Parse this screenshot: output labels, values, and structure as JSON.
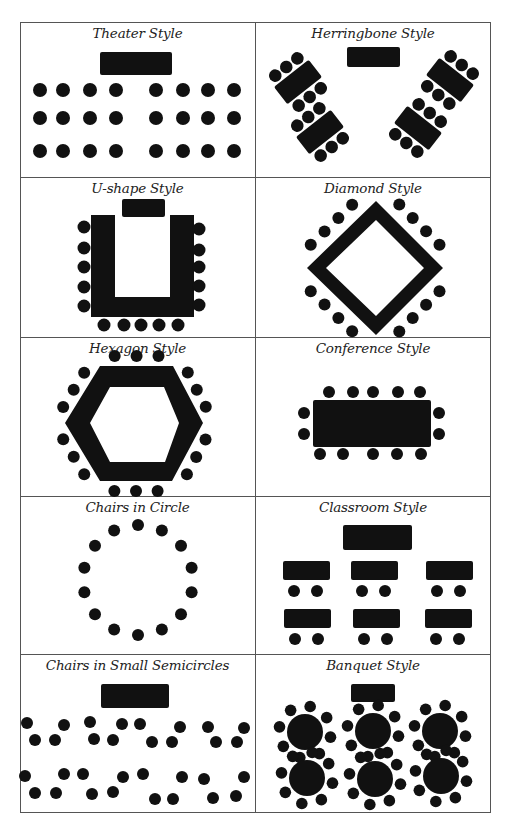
{
  "diagram": {
    "layouts": [
      {
        "id": "theater",
        "label": "Theater Style",
        "head_tables": 1,
        "chairs": 24
      },
      {
        "id": "herringbone",
        "label": "Herringbone Style",
        "head_tables": 1,
        "tables": 4,
        "chairs_per_table": 6
      },
      {
        "id": "u-shape",
        "label": "U-shape Style",
        "head_tables": 1,
        "chairs": 15
      },
      {
        "id": "diamond",
        "label": "Diamond Style",
        "chairs": 16
      },
      {
        "id": "hexagon",
        "label": "Hexagon Style",
        "chairs": 18
      },
      {
        "id": "conference",
        "label": "Conference Style",
        "chairs": 14
      },
      {
        "id": "circle",
        "label": "Chairs in Circle",
        "chairs": 14
      },
      {
        "id": "classroom",
        "label": "Classroom Style",
        "head_tables": 1,
        "desks": 6,
        "chairs_per_desk": 2
      },
      {
        "id": "semicircles",
        "label": "Chairs in Small Semicircles",
        "head_tables": 1,
        "groups": 8,
        "chairs_per_group": 4
      },
      {
        "id": "banquet",
        "label": "Banquet Style",
        "head_tables": 1,
        "round_tables": 6,
        "chairs_per_table": 8
      }
    ],
    "colors": {
      "ink": "#111111",
      "border": "#555555",
      "background": "#ffffff"
    }
  }
}
